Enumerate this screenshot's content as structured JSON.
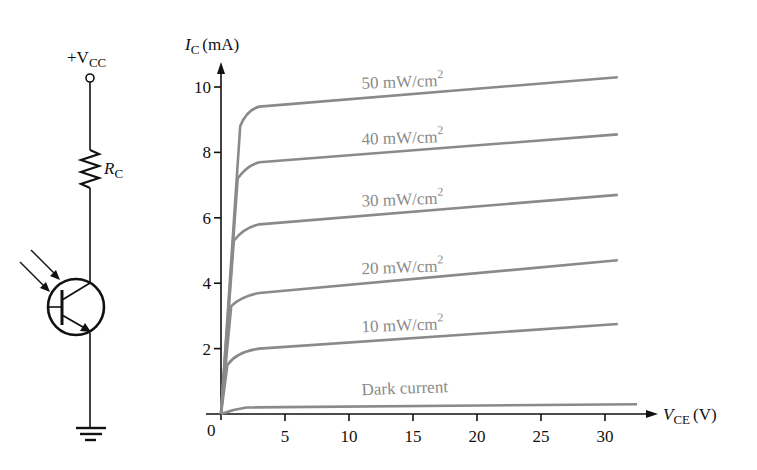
{
  "circuit": {
    "supply_label": "+V",
    "supply_sub": "CC",
    "resistor_label": "R",
    "resistor_sub": "C"
  },
  "chart_data": {
    "type": "line",
    "title": "",
    "ylabel_main": "I",
    "ylabel_sub": "C",
    "ylabel_unit": "(mA)",
    "xlabel_main": "V",
    "xlabel_sub": "CE",
    "xlabel_unit": "(V)",
    "origin_label": "0",
    "xlim": [
      0,
      33
    ],
    "ylim": [
      0,
      11
    ],
    "x_ticks": [
      "5",
      "10",
      "15",
      "20",
      "25",
      "30"
    ],
    "y_ticks": [
      "2",
      "4",
      "6",
      "8",
      "10"
    ],
    "grid": false,
    "curve_color": "#8a8a8a",
    "series": [
      {
        "name": "50 mW/cm²",
        "label_num": "50 mW/cm",
        "points": [
          [
            0,
            0
          ],
          [
            1.5,
            8.8
          ],
          [
            2,
            9.3
          ],
          [
            3,
            9.4
          ],
          [
            31,
            10.3
          ]
        ]
      },
      {
        "name": "40 mW/cm²",
        "label_num": "40 mW/cm",
        "points": [
          [
            0,
            0
          ],
          [
            1.3,
            7.2
          ],
          [
            2,
            7.6
          ],
          [
            3,
            7.7
          ],
          [
            31,
            8.55
          ]
        ]
      },
      {
        "name": "30 mW/cm²",
        "label_num": "30 mW/cm",
        "points": [
          [
            0,
            0
          ],
          [
            1,
            5.3
          ],
          [
            1.8,
            5.7
          ],
          [
            3,
            5.8
          ],
          [
            31,
            6.7
          ]
        ]
      },
      {
        "name": "20 mW/cm²",
        "label_num": "20 mW/cm",
        "points": [
          [
            0,
            0
          ],
          [
            0.8,
            3.3
          ],
          [
            1.6,
            3.6
          ],
          [
            3,
            3.7
          ],
          [
            31,
            4.7
          ]
        ]
      },
      {
        "name": "10 mW/cm²",
        "label_num": "10 mW/cm",
        "points": [
          [
            0,
            0
          ],
          [
            0.5,
            1.5
          ],
          [
            1.2,
            1.9
          ],
          [
            3,
            2.0
          ],
          [
            31,
            2.75
          ]
        ]
      },
      {
        "name": "Dark current",
        "label_num": "Dark current",
        "points": [
          [
            0,
            0
          ],
          [
            1,
            0.15
          ],
          [
            2,
            0.2
          ],
          [
            32.5,
            0.3
          ]
        ]
      }
    ],
    "superscript": "2"
  }
}
